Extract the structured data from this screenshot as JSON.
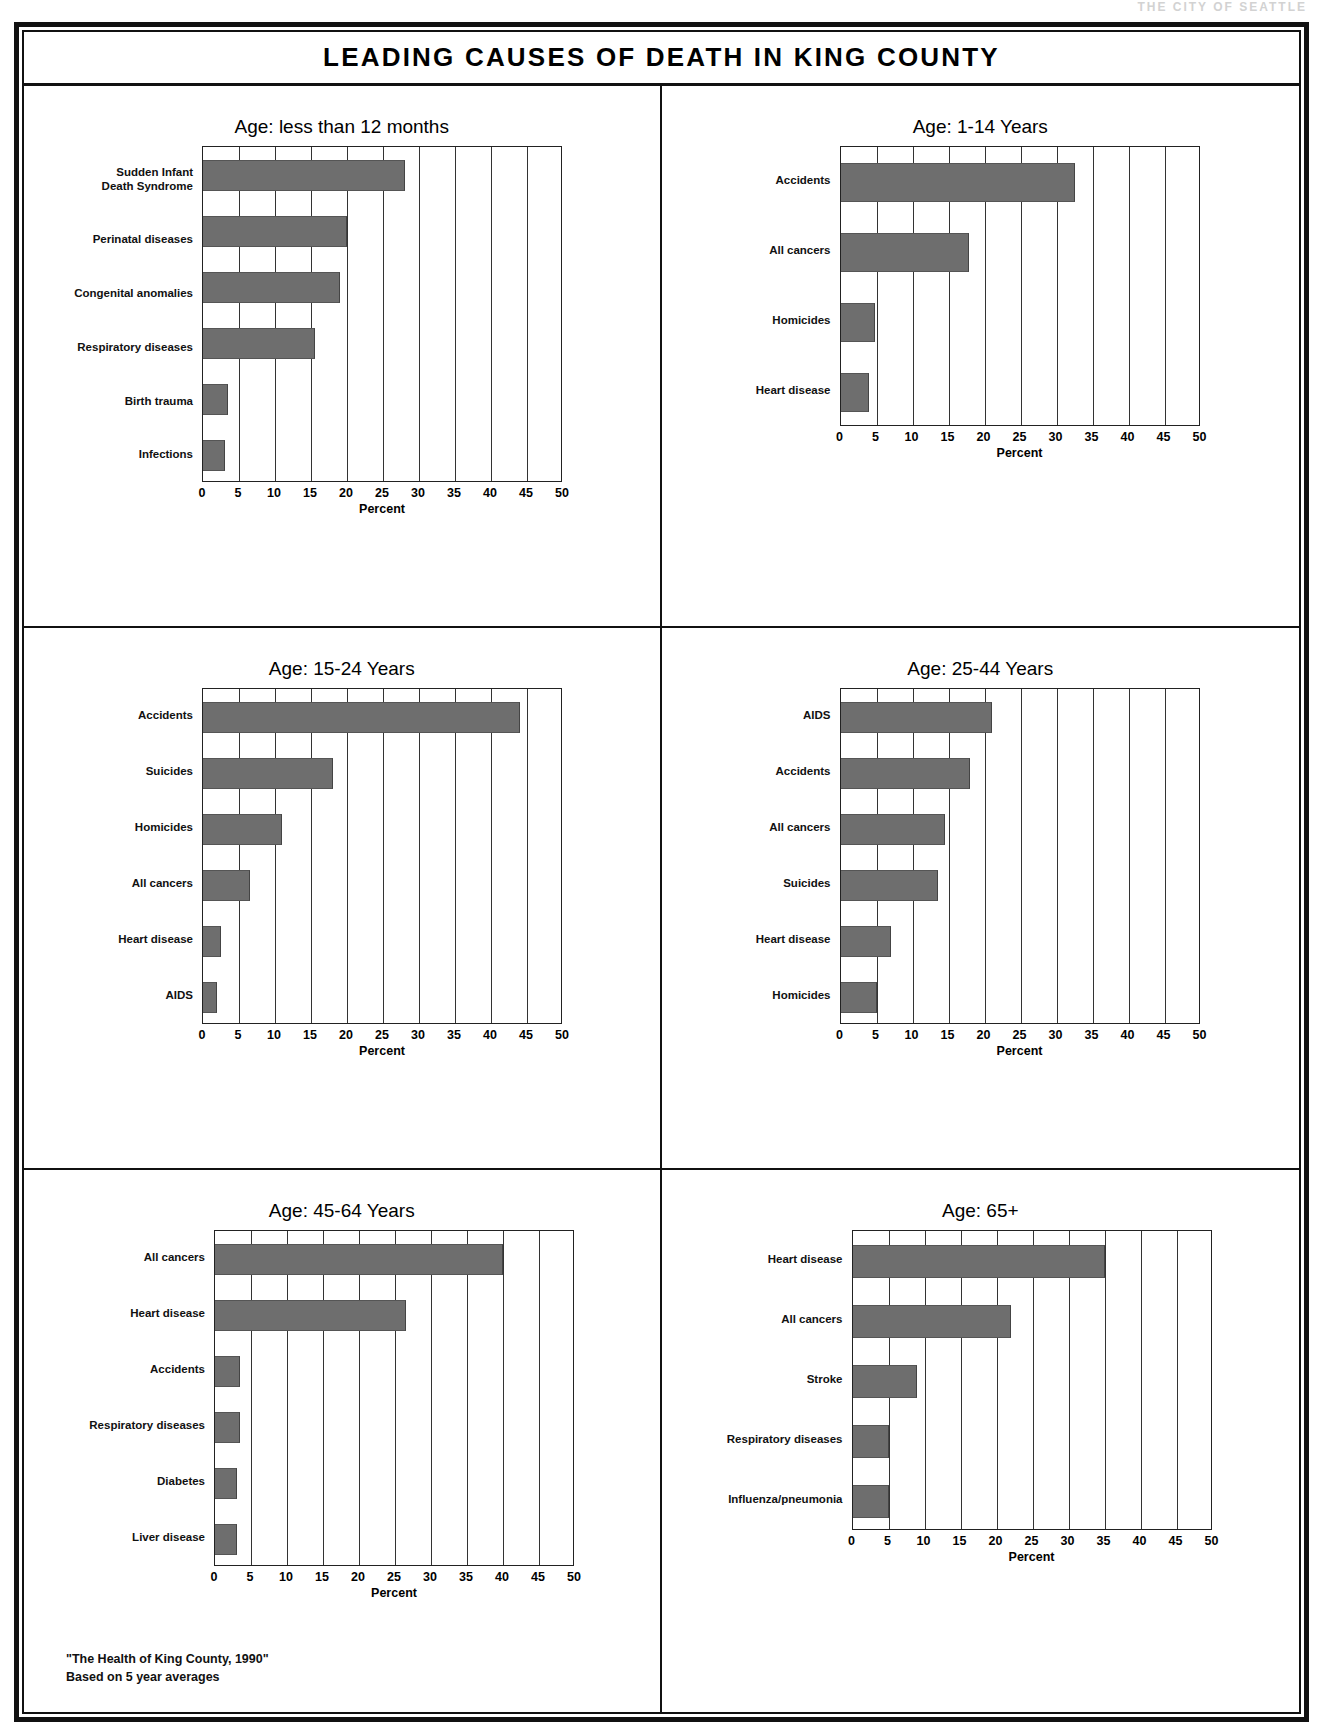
{
  "top_strip_text": "THE CITY OF SEATTLE",
  "poster": {
    "title": "LEADING CAUSES OF DEATH IN KING COUNTY",
    "footnote_line1": "\"The Health of King County, 1990\"",
    "footnote_line2": "Based on 5 year averages"
  },
  "axis": {
    "xlabel": "Percent",
    "ticks": [
      "0",
      "5",
      "10",
      "15",
      "20",
      "25",
      "30",
      "35",
      "40",
      "45",
      "50"
    ],
    "xmin": 0,
    "xmax": 50
  },
  "colors": {
    "bar_fill": "#6e6e6e",
    "frame": "#111111",
    "background": "#ffffff"
  },
  "chart_data": [
    {
      "type": "bar",
      "orientation": "horizontal",
      "title": "Age: less than 12 months",
      "xlabel": "Percent",
      "ylabel": "",
      "xlim": [
        0,
        50
      ],
      "grid": true,
      "legend": "none",
      "categories": [
        "Sudden Infant\nDeath Syndrome",
        "Perinatal diseases",
        "Congenital anomalies",
        "Respiratory diseases",
        "Birth trauma",
        "Infections"
      ],
      "values": [
        28,
        20,
        19,
        15.5,
        3.5,
        3
      ]
    },
    {
      "type": "bar",
      "orientation": "horizontal",
      "title": "Age: 1-14 Years",
      "xlabel": "Percent",
      "ylabel": "",
      "xlim": [
        0,
        50
      ],
      "grid": true,
      "legend": "none",
      "categories": [
        "Accidents",
        "All cancers",
        "Homicides",
        "Heart disease"
      ],
      "values": [
        32.5,
        17.8,
        4.8,
        4.0
      ]
    },
    {
      "type": "bar",
      "orientation": "horizontal",
      "title": "Age: 15-24 Years",
      "xlabel": "Percent",
      "ylabel": "",
      "xlim": [
        0,
        50
      ],
      "grid": true,
      "legend": "none",
      "categories": [
        "Accidents",
        "Suicides",
        "Homicides",
        "All cancers",
        "Heart disease",
        "AIDS"
      ],
      "values": [
        44,
        18,
        11,
        6.5,
        2.5,
        2
      ]
    },
    {
      "type": "bar",
      "orientation": "horizontal",
      "title": "Age: 25-44 Years",
      "xlabel": "Percent",
      "ylabel": "",
      "xlim": [
        0,
        50
      ],
      "grid": true,
      "legend": "none",
      "categories": [
        "AIDS",
        "Accidents",
        "All cancers",
        "Suicides",
        "Heart disease",
        "Homicides"
      ],
      "values": [
        21,
        18,
        14.5,
        13.5,
        7,
        5
      ]
    },
    {
      "type": "bar",
      "orientation": "horizontal",
      "title": "Age: 45-64 Years",
      "xlabel": "Percent",
      "ylabel": "",
      "xlim": [
        0,
        50
      ],
      "grid": true,
      "legend": "none",
      "categories": [
        "All cancers",
        "Heart disease",
        "Accidents",
        "Respiratory diseases",
        "Diabetes",
        "Liver disease"
      ],
      "values": [
        40,
        26.5,
        3.5,
        3.5,
        3,
        3
      ]
    },
    {
      "type": "bar",
      "orientation": "horizontal",
      "title": "Age: 65+",
      "xlabel": "Percent",
      "ylabel": "",
      "xlim": [
        0,
        50
      ],
      "grid": true,
      "legend": "none",
      "categories": [
        "Heart disease",
        "All cancers",
        "Stroke",
        "Respiratory diseases",
        "Influenza/pneumonia"
      ],
      "values": [
        35,
        22,
        9,
        5,
        5
      ]
    }
  ]
}
